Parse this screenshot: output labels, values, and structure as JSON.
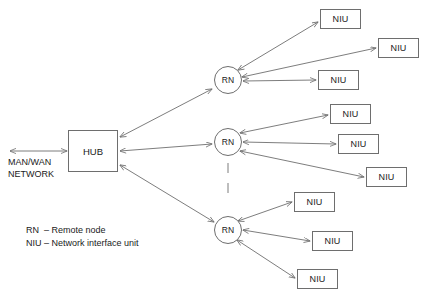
{
  "diagram": {
    "line_color": "#6e6e6e",
    "text_color": "#1a1a1a",
    "background": "#ffffff"
  },
  "wan": {
    "label": "MAN/WAN\nNETWORK",
    "arrow_name": "wan-link-arrow"
  },
  "hub": {
    "label": "HUB",
    "x": 68,
    "y": 130,
    "width": 50,
    "height": 42
  },
  "remote_nodes": [
    {
      "label": "RN",
      "cx": 228,
      "cy": 80,
      "r": 14
    },
    {
      "label": "RN",
      "cx": 228,
      "cy": 142,
      "r": 14
    },
    {
      "label": "RN",
      "cx": 228,
      "cy": 230,
      "r": 14
    }
  ],
  "niu_groups": [
    {
      "group_name": "niu-group-top",
      "units": [
        {
          "label": "NIU",
          "x": 320,
          "y": 9,
          "width": 41,
          "height": 20
        },
        {
          "label": "NIU",
          "x": 378,
          "y": 38,
          "width": 41,
          "height": 20
        },
        {
          "label": "NIU",
          "x": 318,
          "y": 70,
          "width": 41,
          "height": 20
        }
      ]
    },
    {
      "group_name": "niu-group-middle",
      "units": [
        {
          "label": "NIU",
          "x": 330,
          "y": 104,
          "width": 41,
          "height": 20
        },
        {
          "label": "NIU",
          "x": 338,
          "y": 134,
          "width": 41,
          "height": 20
        },
        {
          "label": "NIU",
          "x": 366,
          "y": 167,
          "width": 41,
          "height": 20
        }
      ]
    },
    {
      "group_name": "niu-group-bottom",
      "units": [
        {
          "label": "NIU",
          "x": 294,
          "y": 192,
          "width": 41,
          "height": 20
        },
        {
          "label": "NIU",
          "x": 312,
          "y": 231,
          "width": 41,
          "height": 20
        },
        {
          "label": "NIU",
          "x": 297,
          "y": 269,
          "width": 41,
          "height": 20
        }
      ]
    }
  ],
  "continuation": {
    "name": "vertical-ellipsis",
    "dashes": [
      {
        "x": 228,
        "y1": 163,
        "y2": 173
      },
      {
        "x": 228,
        "y1": 183,
        "y2": 193
      }
    ]
  },
  "legend": {
    "line1": "RN  – Remote node",
    "line2": "NIU – Network interface unit"
  }
}
